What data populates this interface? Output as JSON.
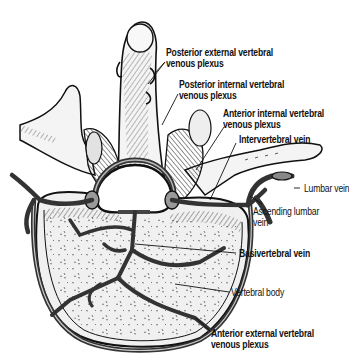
{
  "figure": {
    "labels": [
      {
        "id": "posterior-external",
        "lines": [
          "Posterior external vertebral",
          "venous plexus"
        ],
        "bold": true
      },
      {
        "id": "posterior-internal",
        "lines": [
          "Posterior internal vertebral",
          "venous plexus"
        ],
        "bold": true
      },
      {
        "id": "anterior-internal",
        "lines": [
          "Anterior internal vertebral",
          "venous plexus"
        ],
        "bold": true
      },
      {
        "id": "intervertebral-vein",
        "lines": [
          "Intervertebral vein"
        ],
        "bold": true
      },
      {
        "id": "lumbar-vein",
        "lines": [
          "Lumbar vein"
        ],
        "bold": false
      },
      {
        "id": "ascending-lumbar-vein",
        "lines": [
          "Ascending lumbar",
          "vein"
        ],
        "bold": false
      },
      {
        "id": "basivertebral-vein",
        "lines": [
          "Basivertebral vein"
        ],
        "bold": true
      },
      {
        "id": "vertebral-body",
        "lines": [
          "Vertebral body"
        ],
        "bold": false
      },
      {
        "id": "anterior-external",
        "lines": [
          "Anterior external vertebral",
          "venous plexus"
        ],
        "bold": true
      }
    ]
  },
  "colors": {
    "ink": "#111111",
    "bone_fill": "#f2f2f2",
    "vein_fill": "#555555",
    "background": "#ffffff"
  }
}
